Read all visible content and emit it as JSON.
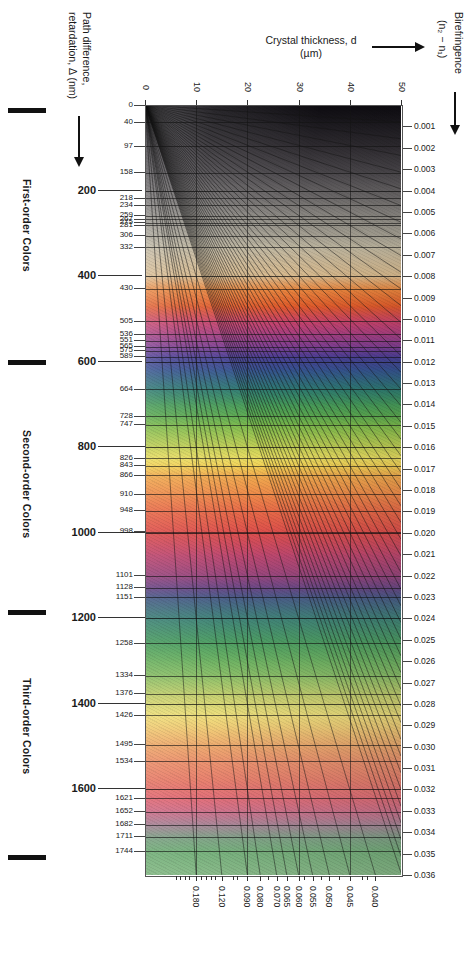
{
  "chart_data": {
    "type": "heatmap",
    "xlabel": "Crystal thickness, d (µm)",
    "ylabel": "Path difference, retardation, Δ (nm)",
    "y2label": "Birefringence (n₂ − n₁)",
    "xlim": [
      0,
      50
    ],
    "ylim": [
      0,
      1800
    ],
    "grid": true,
    "legend": "none",
    "x_ticks": [
      0,
      10,
      20,
      30,
      40,
      50
    ],
    "retardation_major_ticks": [
      200,
      400,
      600,
      800,
      1000,
      1200,
      1400,
      1600
    ],
    "retardation_minor_ticks": [
      0,
      40,
      97,
      158,
      218,
      234,
      259,
      267,
      275,
      281,
      306,
      332,
      430,
      505,
      536,
      551,
      565,
      575,
      589,
      664,
      728,
      747,
      826,
      843,
      866,
      910,
      948,
      998,
      1101,
      1128,
      1151,
      1258,
      1334,
      1376,
      1426,
      1495,
      1534,
      1621,
      1652,
      1682,
      1711,
      1744
    ],
    "birefringence_right_ticks": [
      0.001,
      0.002,
      0.003,
      0.004,
      0.005,
      0.006,
      0.007,
      0.008,
      0.009,
      0.01,
      0.011,
      0.012,
      0.013,
      0.014,
      0.015,
      0.016,
      0.017,
      0.018,
      0.019,
      0.02,
      0.021,
      0.022,
      0.023,
      0.024,
      0.025,
      0.026,
      0.027,
      0.028,
      0.029,
      0.03,
      0.031,
      0.032,
      0.033,
      0.034,
      0.035,
      0.036
    ],
    "birefringence_bottom_labels": [
      "0.180",
      "0.120",
      "0.090",
      "0.080",
      "0.070",
      "0.065",
      "0.060",
      "0.055",
      "0.050",
      "0.045",
      "0.040"
    ],
    "color_stops": [
      {
        "r": 0,
        "c": "#0d0b10"
      },
      {
        "r": 40,
        "c": "#1a181d"
      },
      {
        "r": 97,
        "c": "#2e2b30"
      },
      {
        "r": 158,
        "c": "#4a474b"
      },
      {
        "r": 218,
        "c": "#6d6a6a"
      },
      {
        "r": 259,
        "c": "#8b8882"
      },
      {
        "r": 306,
        "c": "#a6a193"
      },
      {
        "r": 332,
        "c": "#bdb59f"
      },
      {
        "r": 400,
        "c": "#d8b98c"
      },
      {
        "r": 430,
        "c": "#e8873f"
      },
      {
        "r": 470,
        "c": "#e05a2a"
      },
      {
        "r": 505,
        "c": "#c9436a"
      },
      {
        "r": 536,
        "c": "#a63f82"
      },
      {
        "r": 565,
        "c": "#7c3f93"
      },
      {
        "r": 589,
        "c": "#4a3f95"
      },
      {
        "r": 620,
        "c": "#35538f"
      },
      {
        "r": 664,
        "c": "#2e7a72"
      },
      {
        "r": 700,
        "c": "#45995a"
      },
      {
        "r": 728,
        "c": "#5dab50"
      },
      {
        "r": 747,
        "c": "#7cba4c"
      },
      {
        "r": 800,
        "c": "#c3cf55"
      },
      {
        "r": 826,
        "c": "#eadd62"
      },
      {
        "r": 843,
        "c": "#f2cf55"
      },
      {
        "r": 866,
        "c": "#f0ab4e"
      },
      {
        "r": 910,
        "c": "#ee8a4a"
      },
      {
        "r": 948,
        "c": "#e86a48"
      },
      {
        "r": 998,
        "c": "#de4f4c"
      },
      {
        "r": 1050,
        "c": "#c0486e"
      },
      {
        "r": 1101,
        "c": "#97477f"
      },
      {
        "r": 1128,
        "c": "#6a4a88"
      },
      {
        "r": 1151,
        "c": "#4b5d8a"
      },
      {
        "r": 1200,
        "c": "#41847a"
      },
      {
        "r": 1258,
        "c": "#4fa063"
      },
      {
        "r": 1300,
        "c": "#6fb364"
      },
      {
        "r": 1334,
        "c": "#8dc06a"
      },
      {
        "r": 1376,
        "c": "#c2cf70"
      },
      {
        "r": 1426,
        "c": "#efe07e"
      },
      {
        "r": 1460,
        "c": "#f0c877"
      },
      {
        "r": 1495,
        "c": "#eeab70"
      },
      {
        "r": 1534,
        "c": "#ec9470"
      },
      {
        "r": 1580,
        "c": "#e8806f"
      },
      {
        "r": 1621,
        "c": "#e3707a"
      },
      {
        "r": 1652,
        "c": "#cf7690"
      },
      {
        "r": 1682,
        "c": "#a98b9b"
      },
      {
        "r": 1711,
        "c": "#85a58c"
      },
      {
        "r": 1744,
        "c": "#79b37f"
      },
      {
        "r": 1800,
        "c": "#8cbd8c"
      }
    ]
  },
  "orders": [
    {
      "label": "First-order Colors"
    },
    {
      "label": "Second-order Colors"
    },
    {
      "label": "Third-order Colors"
    }
  ],
  "axes": {
    "left_title_line1": "Path difference,",
    "left_title_line2": "retardation, Δ (nm)",
    "top_title_line1": "Crystal thickness, d",
    "top_title_line2": "(µm)",
    "right_title_line1": "Birefringence",
    "right_title_line2": "(n₂ − n₁)"
  }
}
